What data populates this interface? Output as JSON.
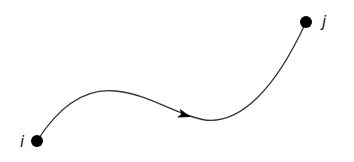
{
  "diagram": {
    "type": "directed-path",
    "nodes": [
      {
        "id": "i",
        "label": "i",
        "cx": 37,
        "cy": 141,
        "r": 6,
        "label_x": 20,
        "label_y": 147
      },
      {
        "id": "j",
        "label": "j",
        "cx": 306,
        "cy": 22,
        "r": 6,
        "label_x": 322,
        "label_y": 27
      }
    ],
    "edge": {
      "from": "i",
      "to": "j",
      "path": "M37,141 C60,105 85,88 115,91 C150,94 175,115 205,120 C240,124 275,90 306,22",
      "arrow_at": {
        "x": 188,
        "y": 116,
        "angle": 17
      },
      "color": "#333333"
    },
    "colors": {
      "node": "#000000",
      "edge": "#333333",
      "background": "#ffffff"
    }
  }
}
